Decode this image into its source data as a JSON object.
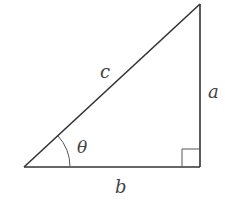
{
  "diagram": {
    "type": "right-triangle",
    "stroke_color": "#333333",
    "label_color": "#444444",
    "vertices": {
      "left": [
        24,
        167
      ],
      "right_angle": [
        200,
        167
      ],
      "top": [
        200,
        4
      ]
    },
    "labels": {
      "hypotenuse": "c",
      "opposite": "a",
      "adjacent": "b",
      "angle": "θ"
    },
    "right_angle_marker": true,
    "angle_arc": true
  }
}
